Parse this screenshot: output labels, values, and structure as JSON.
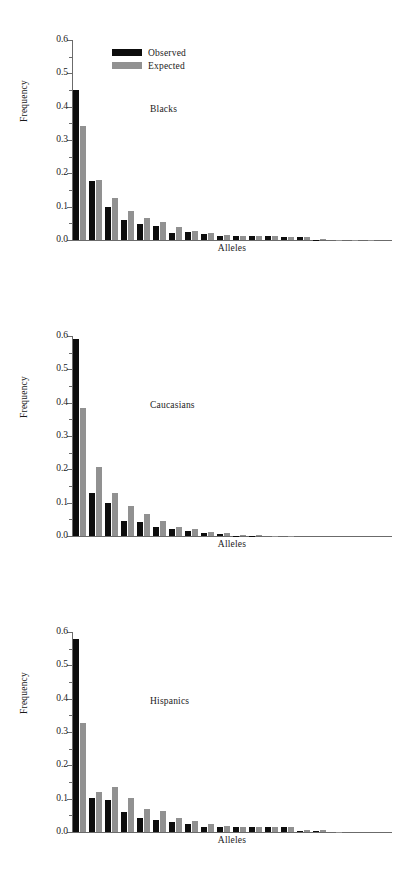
{
  "figure": {
    "ylabel": "Frequency",
    "xlabel": "Alleles",
    "legend": {
      "observed_label": "Observed",
      "expected_label": "Expected",
      "observed_color": "#0d0d0d",
      "expected_color": "#919191"
    },
    "ytick_labels": [
      "0.6",
      "0.5",
      "0.4",
      "0.3",
      "0.2",
      "0.1",
      "0.0"
    ]
  },
  "chart_data": [
    {
      "type": "bar",
      "title": "Blacks",
      "xlabel": "Alleles",
      "ylabel": "Frequency",
      "ylim": [
        0.0,
        0.6
      ],
      "yticks": [
        0.0,
        0.1,
        0.2,
        0.3,
        0.4,
        0.5,
        0.6
      ],
      "grid": false,
      "legend_position": "top-left",
      "categories": [
        "1",
        "2",
        "3",
        "4",
        "5",
        "6",
        "7",
        "8",
        "9",
        "10",
        "11",
        "12",
        "13",
        "14",
        "15",
        "16",
        "17",
        "18",
        "19",
        "20"
      ],
      "series": [
        {
          "name": "Observed",
          "color": "#0d0d0d",
          "values": [
            0.451,
            0.178,
            0.098,
            0.06,
            0.049,
            0.043,
            0.022,
            0.024,
            0.017,
            0.011,
            0.011,
            0.011,
            0.011,
            0.008,
            0.009,
            0.001,
            0.0,
            0.0,
            0.0,
            0.0
          ]
        },
        {
          "name": "Expected",
          "color": "#919191",
          "values": [
            0.342,
            0.18,
            0.125,
            0.087,
            0.065,
            0.054,
            0.038,
            0.026,
            0.02,
            0.014,
            0.013,
            0.012,
            0.012,
            0.008,
            0.009,
            0.002,
            0.001,
            0.001,
            0.001,
            0.0
          ]
        }
      ]
    },
    {
      "type": "bar",
      "title": "Caucasians",
      "xlabel": "Alleles",
      "ylabel": "Frequency",
      "ylim": [
        0.0,
        0.6
      ],
      "yticks": [
        0.0,
        0.1,
        0.2,
        0.3,
        0.4,
        0.5,
        0.6
      ],
      "grid": false,
      "legend_position": "none",
      "categories": [
        "1",
        "2",
        "3",
        "4",
        "5",
        "6",
        "7",
        "8",
        "9",
        "10",
        "11",
        "12",
        "13",
        "14",
        "15",
        "16",
        "17",
        "18",
        "19",
        "20"
      ],
      "series": [
        {
          "name": "Observed",
          "color": "#0d0d0d",
          "values": [
            0.59,
            0.128,
            0.098,
            0.045,
            0.043,
            0.028,
            0.021,
            0.014,
            0.009,
            0.005,
            0.001,
            0.001,
            0.0,
            0.0,
            0.0,
            0.0,
            0.0,
            0.0,
            0.0,
            0.0
          ]
        },
        {
          "name": "Expected",
          "color": "#919191",
          "values": [
            0.385,
            0.207,
            0.129,
            0.089,
            0.065,
            0.045,
            0.028,
            0.022,
            0.013,
            0.009,
            0.003,
            0.003,
            0.001,
            0.001,
            0.0,
            0.0,
            0.0,
            0.0,
            0.0,
            0.0
          ]
        }
      ]
    },
    {
      "type": "bar",
      "title": "Hispanics",
      "xlabel": "Alleles",
      "ylabel": "Frequency",
      "ylim": [
        0.0,
        0.6
      ],
      "yticks": [
        0.0,
        0.1,
        0.2,
        0.3,
        0.4,
        0.5,
        0.6
      ],
      "grid": false,
      "legend_position": "none",
      "categories": [
        "1",
        "2",
        "3",
        "4",
        "5",
        "6",
        "7",
        "8",
        "9",
        "10",
        "11",
        "12",
        "13",
        "14",
        "15",
        "16",
        "17",
        "18",
        "19",
        "20"
      ],
      "series": [
        {
          "name": "Observed",
          "color": "#0d0d0d",
          "values": [
            0.58,
            0.101,
            0.095,
            0.061,
            0.042,
            0.035,
            0.029,
            0.023,
            0.015,
            0.015,
            0.014,
            0.015,
            0.016,
            0.016,
            0.003,
            0.004,
            0.0,
            0.0,
            0.0,
            0.0
          ]
        },
        {
          "name": "Expected",
          "color": "#919191",
          "values": [
            0.328,
            0.12,
            0.136,
            0.101,
            0.068,
            0.062,
            0.042,
            0.034,
            0.025,
            0.017,
            0.015,
            0.015,
            0.016,
            0.016,
            0.005,
            0.006,
            0.001,
            0.0,
            0.0,
            0.0
          ]
        }
      ]
    }
  ]
}
